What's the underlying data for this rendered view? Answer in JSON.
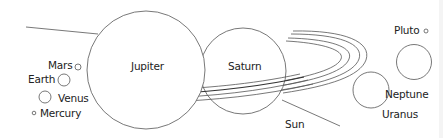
{
  "diagram": {
    "colors": {
      "stroke": "#555555",
      "ring_dark": "#333333",
      "text": "#222222",
      "background": "#ffffff"
    },
    "labels": {
      "mars": "Mars",
      "earth": "Earth",
      "venus": "Venus",
      "mercury": "Mercury",
      "jupiter": "Jupiter",
      "saturn": "Saturn",
      "sun": "Sun",
      "pluto": "Pluto",
      "neptune": "Neptune",
      "uranus": "Uranus"
    }
  }
}
